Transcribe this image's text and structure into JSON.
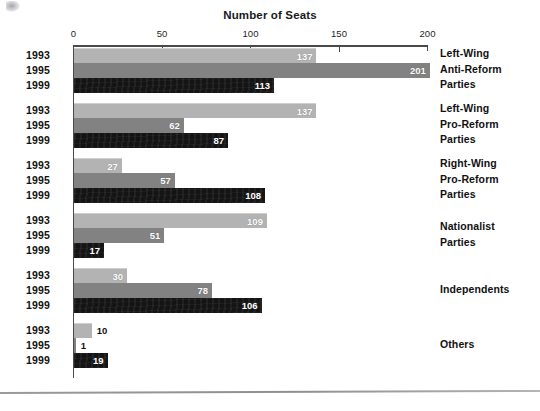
{
  "chart_data": {
    "type": "bar",
    "orientation": "horizontal",
    "title": "Number of Seats",
    "xlabel": "Number of Seats",
    "ylabel": "",
    "xlim": [
      0,
      200
    ],
    "xticks": [
      0,
      50,
      100,
      150,
      200
    ],
    "grid": false,
    "legend_position": "none",
    "categories": [
      "Left-Wing Anti-Reform Parties",
      "Left-Wing Pro-Reform Parties",
      "Right-Wing Pro-Reform Parties",
      "Nationalist Parties",
      "Independents",
      "Others"
    ],
    "series": [
      {
        "name": "1993",
        "color": "#b3b3b3",
        "values": [
          137,
          137,
          27,
          109,
          30,
          10
        ]
      },
      {
        "name": "1995",
        "color": "#828282",
        "values": [
          201,
          62,
          57,
          51,
          78,
          1
        ]
      },
      {
        "name": "1999",
        "color": "#141414",
        "values": [
          113,
          87,
          108,
          17,
          106,
          19
        ]
      }
    ]
  },
  "axis": {
    "ticks": [
      {
        "label": "0",
        "value": 0
      },
      {
        "label": "50",
        "value": 50
      },
      {
        "label": "100",
        "value": 100
      },
      {
        "label": "150",
        "value": 150
      },
      {
        "label": "200",
        "value": 200
      }
    ]
  },
  "groups": [
    {
      "label_lines": [
        "Left-Wing",
        "Anti-Reform",
        "Parties"
      ],
      "rows": [
        {
          "year": "1993",
          "value": 137,
          "series": "1993"
        },
        {
          "year": "1995",
          "value": 201,
          "series": "1995"
        },
        {
          "year": "1999",
          "value": 113,
          "series": "1999"
        }
      ]
    },
    {
      "label_lines": [
        "Left-Wing",
        "Pro-Reform",
        "Parties"
      ],
      "rows": [
        {
          "year": "1993",
          "value": 137,
          "series": "1993"
        },
        {
          "year": "1995",
          "value": 62,
          "series": "1995"
        },
        {
          "year": "1999",
          "value": 87,
          "series": "1999"
        }
      ]
    },
    {
      "label_lines": [
        "Right-Wing",
        "Pro-Reform",
        "Parties"
      ],
      "rows": [
        {
          "year": "1993",
          "value": 27,
          "series": "1993"
        },
        {
          "year": "1995",
          "value": 57,
          "series": "1995"
        },
        {
          "year": "1999",
          "value": 108,
          "series": "1999"
        }
      ]
    },
    {
      "label_lines": [
        "Nationalist",
        "Parties"
      ],
      "rows": [
        {
          "year": "1993",
          "value": 109,
          "series": "1993"
        },
        {
          "year": "1995",
          "value": 51,
          "series": "1995"
        },
        {
          "year": "1999",
          "value": 17,
          "series": "1999"
        }
      ]
    },
    {
      "label_lines": [
        "Independents"
      ],
      "rows": [
        {
          "year": "1993",
          "value": 30,
          "series": "1993"
        },
        {
          "year": "1995",
          "value": 78,
          "series": "1995"
        },
        {
          "year": "1999",
          "value": 106,
          "series": "1999"
        }
      ]
    },
    {
      "label_lines": [
        "Others"
      ],
      "rows": [
        {
          "year": "1993",
          "value": 10,
          "series": "1993"
        },
        {
          "year": "1995",
          "value": 1,
          "series": "1995"
        },
        {
          "year": "1999",
          "value": 19,
          "series": "1999"
        }
      ]
    }
  ],
  "colors": {
    "series_1993": "#b3b3b3",
    "series_1995": "#828282",
    "series_1999": "#141414",
    "axis": "#4a4a4a",
    "text": "#111111"
  }
}
